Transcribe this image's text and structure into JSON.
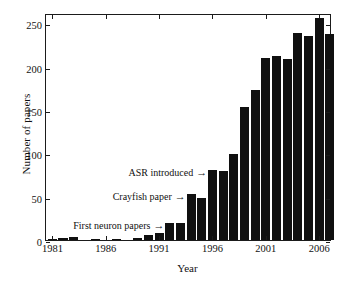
{
  "chart_data": {
    "type": "bar",
    "title": "",
    "xlabel": "Year",
    "ylabel": "Number of papers",
    "grid": false,
    "legend": null,
    "xlim": [
      1980.4,
      2007.2
    ],
    "ylim": [
      0,
      262
    ],
    "x_tick_labels": [
      "1981",
      "1986",
      "1991",
      "1996",
      "2001",
      "2006"
    ],
    "x_tick_values": [
      1981,
      1986,
      1991,
      1996,
      2001,
      2006
    ],
    "y_tick_labels": [
      "0",
      "50",
      "100",
      "150",
      "200",
      "250"
    ],
    "y_tick_values": [
      0,
      50,
      100,
      150,
      200,
      250
    ],
    "bar_color": "#101010",
    "background_color": "#ffffff",
    "axis_color": "#1b1b1b",
    "categories": [
      1981,
      1982,
      1983,
      1984,
      1985,
      1986,
      1987,
      1988,
      1989,
      1990,
      1991,
      1992,
      1993,
      1994,
      1995,
      1996,
      1997,
      1998,
      1999,
      2000,
      2001,
      2002,
      2003,
      2004,
      2005,
      2006
    ],
    "values": [
      1,
      2,
      3,
      0,
      1,
      0,
      1,
      0,
      2,
      6,
      8,
      20,
      20,
      53,
      49,
      81,
      80,
      99,
      154,
      173,
      210,
      212,
      209,
      239,
      235,
      256
    ],
    "extra_bar": {
      "label": "2007",
      "value": 238
    },
    "annotations": [
      {
        "id": "asr",
        "text": "ASR introduced",
        "arrow": "→",
        "x": 1996,
        "y": 81
      },
      {
        "id": "crayfish",
        "text": "Crayfish paper",
        "arrow": "→",
        "x": 1994,
        "y": 53
      },
      {
        "id": "first-neuron",
        "text": "First neuron papers",
        "arrow": "→",
        "x": 1992,
        "y": 20
      }
    ]
  }
}
